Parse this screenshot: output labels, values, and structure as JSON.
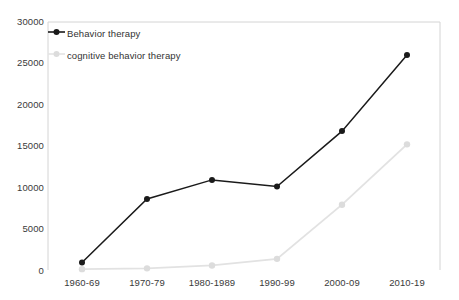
{
  "chart_data": {
    "type": "line",
    "title": "",
    "xlabel": "",
    "ylabel": "",
    "categories": [
      "1960-69",
      "1970-79",
      "1980-1989",
      "1990-99",
      "2000-09",
      "2010-19"
    ],
    "series": [
      {
        "name": "Behavior therapy",
        "color": "#1a1a1a",
        "marker": "circle",
        "values": [
          900,
          8600,
          10900,
          10100,
          16800,
          26000
        ]
      },
      {
        "name": "cognitive behavior therapy",
        "color": "#dcdcdc",
        "marker": "circle",
        "values": [
          100,
          200,
          550,
          1350,
          7900,
          15200
        ]
      }
    ],
    "ylim": [
      0,
      30000
    ],
    "ytick_labels": [
      "0",
      "5000",
      "10000",
      "15000",
      "20000",
      "25000",
      "30000"
    ],
    "ytick_values": [
      0,
      5000,
      10000,
      15000,
      20000,
      25000,
      30000
    ],
    "grid": false,
    "legend_position": "top-left",
    "legend_entries": [
      {
        "label": "Behavior therapy",
        "color": "#1a1a1a"
      },
      {
        "label": "cognitive behavior therapy",
        "color": "#dcdcdc"
      }
    ]
  },
  "axes": {
    "axis_color": "#d0d0d0",
    "tick_text_color": "#3a3a3a"
  }
}
